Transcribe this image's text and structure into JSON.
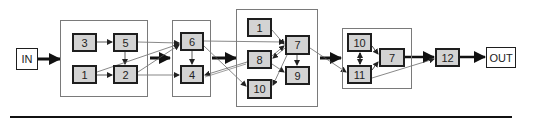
{
  "diagram": {
    "type": "block-flow-diagram",
    "input": {
      "label": "IN"
    },
    "output": {
      "label": "OUT"
    },
    "groups": [
      {
        "id": "g1",
        "nodes": [
          "3",
          "5",
          "1",
          "2"
        ]
      },
      {
        "id": "g2",
        "nodes": [
          "6",
          "4"
        ]
      },
      {
        "id": "g3",
        "nodes": [
          "1",
          "7",
          "8",
          "9",
          "10"
        ]
      },
      {
        "id": "g4",
        "nodes": [
          "10",
          "7",
          "11"
        ]
      }
    ],
    "nodes": {
      "in": "IN",
      "g1_3": "3",
      "g1_5": "5",
      "g1_1": "1",
      "g1_2": "2",
      "g2_6": "6",
      "g2_4": "4",
      "g3_1": "1",
      "g3_7": "7",
      "g3_8": "8",
      "g3_9": "9",
      "g3_10": "10",
      "g4_10": "10",
      "g4_7": "7",
      "g4_11": "11",
      "n12": "12",
      "out": "OUT"
    },
    "edges": [
      {
        "from": "IN",
        "to": "g1",
        "style": "thick"
      },
      {
        "from": "g1.3",
        "to": "g1.5"
      },
      {
        "from": "g1.1",
        "to": "g1.2"
      },
      {
        "from": "g1.5",
        "to": "g1.2"
      },
      {
        "from": "g1.5",
        "to": "g2.6"
      },
      {
        "from": "g1.1",
        "to": "g2.6"
      },
      {
        "from": "g1.2",
        "to": "g2.6"
      },
      {
        "from": "g1.2",
        "to": "g2.4"
      },
      {
        "from": "g1",
        "to": "g2",
        "style": "thick"
      },
      {
        "from": "g2.6",
        "to": "g2.4"
      },
      {
        "from": "g2.6",
        "to": "g3.7"
      },
      {
        "from": "g2.6",
        "to": "g3.10"
      },
      {
        "from": "g3.8",
        "to": "g2.4"
      },
      {
        "from": "g2",
        "to": "g3",
        "style": "thick"
      },
      {
        "from": "g3.1",
        "to": "g3.7"
      },
      {
        "from": "g3.8",
        "to": "g3.7"
      },
      {
        "from": "g3.7",
        "to": "g3.8"
      },
      {
        "from": "g3.7",
        "to": "g3.9"
      },
      {
        "from": "g3.8",
        "to": "g3.9"
      },
      {
        "from": "g3.7",
        "to": "g3.10"
      },
      {
        "from": "g3.7",
        "to": "g4.11"
      },
      {
        "from": "g3",
        "to": "g4",
        "style": "thick"
      },
      {
        "from": "g4.10",
        "to": "g4.11",
        "style": "bidirectional"
      },
      {
        "from": "g4.10",
        "to": "g4.7"
      },
      {
        "from": "g4.11",
        "to": "g4.7"
      },
      {
        "from": "g4.7",
        "to": "12",
        "style": "thick"
      },
      {
        "from": "g4.11",
        "to": "12"
      },
      {
        "from": "12",
        "to": "OUT",
        "style": "thick"
      }
    ],
    "colors": {
      "node_fill": "#d3d3d3",
      "node_border": "#1e1e1e",
      "group_border": "#7a7a7a",
      "io_fill": "#ffffff",
      "edge": "#333333"
    }
  }
}
